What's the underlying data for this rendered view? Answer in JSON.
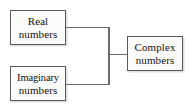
{
  "diagram": {
    "type": "tree",
    "background_color": "#ffffff",
    "box_fill_color": "#fbfbfa",
    "box_border_color": "#58595b",
    "connector_color": "#6b6b6b",
    "text_color": "#111111",
    "nodes": [
      {
        "id": "real",
        "line1": "Real",
        "line2": "numbers",
        "x": 10,
        "y": 10,
        "width": 56,
        "height": 35
      },
      {
        "id": "imaginary",
        "line1": "Imaginary",
        "line2": "numbers",
        "x": 10,
        "y": 66,
        "width": 56,
        "height": 35
      },
      {
        "id": "complex",
        "line1": "Complex",
        "line2": "numbers",
        "x": 127,
        "y": 36,
        "width": 56,
        "height": 35
      }
    ],
    "connectors": [
      {
        "id": "real-to-junction",
        "from": "real",
        "to": "junction",
        "points": "66,27 109,27"
      },
      {
        "id": "imaginary-to-junction",
        "from": "imaginary",
        "to": "junction",
        "points": "66,84 109,84"
      },
      {
        "id": "junction-spine",
        "from": "junction-top",
        "to": "junction-bottom",
        "points": "109,27 109,84"
      },
      {
        "id": "junction-to-complex",
        "from": "junction",
        "to": "complex",
        "points": "109,54 127,54"
      }
    ]
  }
}
